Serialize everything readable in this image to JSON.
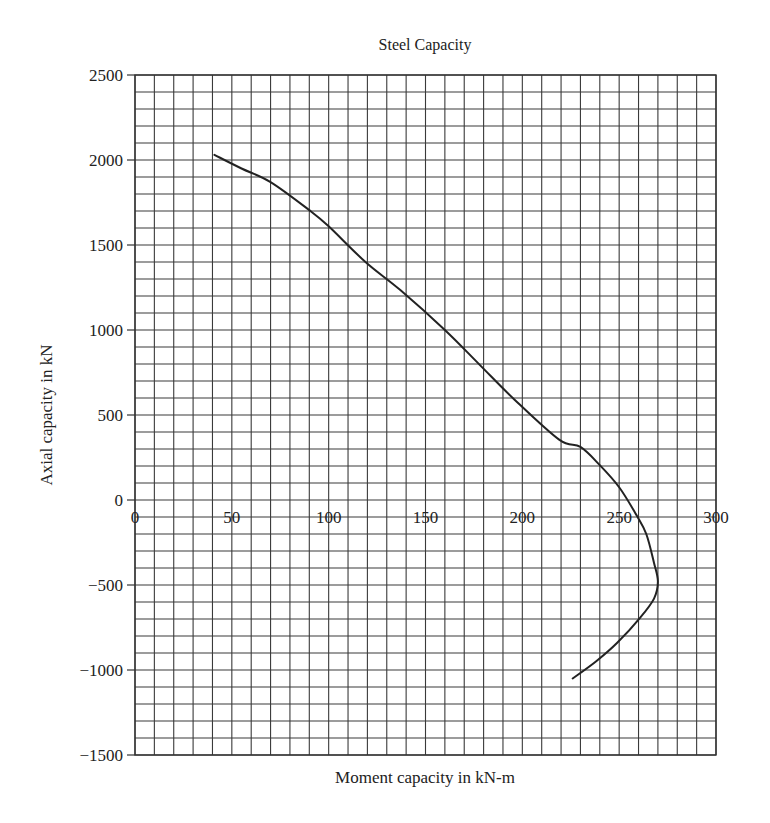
{
  "chart_data": {
    "type": "line",
    "title": "Steel Capacity",
    "xlabel": "Moment capacity in kN-m",
    "ylabel": "Axial capacity in kN",
    "xlim": [
      0,
      300
    ],
    "ylim": [
      -1500,
      2500
    ],
    "x_ticks": [
      0,
      50,
      100,
      150,
      200,
      250,
      300
    ],
    "y_ticks": [
      2500,
      2000,
      1500,
      1000,
      500,
      0,
      -500,
      -1000,
      -1500
    ],
    "x_tick_labels": [
      "0",
      "50",
      "100",
      "150",
      "200",
      "250",
      "300"
    ],
    "y_tick_labels": [
      "2500",
      "2000",
      "1500",
      "1000",
      "500",
      "0",
      "−500",
      "−1000",
      "−1500"
    ],
    "grid": true,
    "grid_minor_x_step": 10,
    "grid_minor_y_step": 100,
    "legend": null,
    "series": [
      {
        "name": "Steel capacity interaction curve",
        "color": "#222222",
        "x": [
          41,
          55,
          70,
          90,
          100,
          119,
          137,
          160,
          178,
          196,
          219,
          230,
          240,
          250,
          259,
          264,
          268,
          270,
          268,
          261,
          249,
          238,
          226
        ],
        "y": [
          2030,
          1950,
          1870,
          1705,
          1610,
          1400,
          1235,
          1000,
          795,
          590,
          355,
          312,
          205,
          75,
          -90,
          -200,
          -370,
          -480,
          -580,
          -690,
          -840,
          -950,
          -1050
        ]
      }
    ]
  }
}
